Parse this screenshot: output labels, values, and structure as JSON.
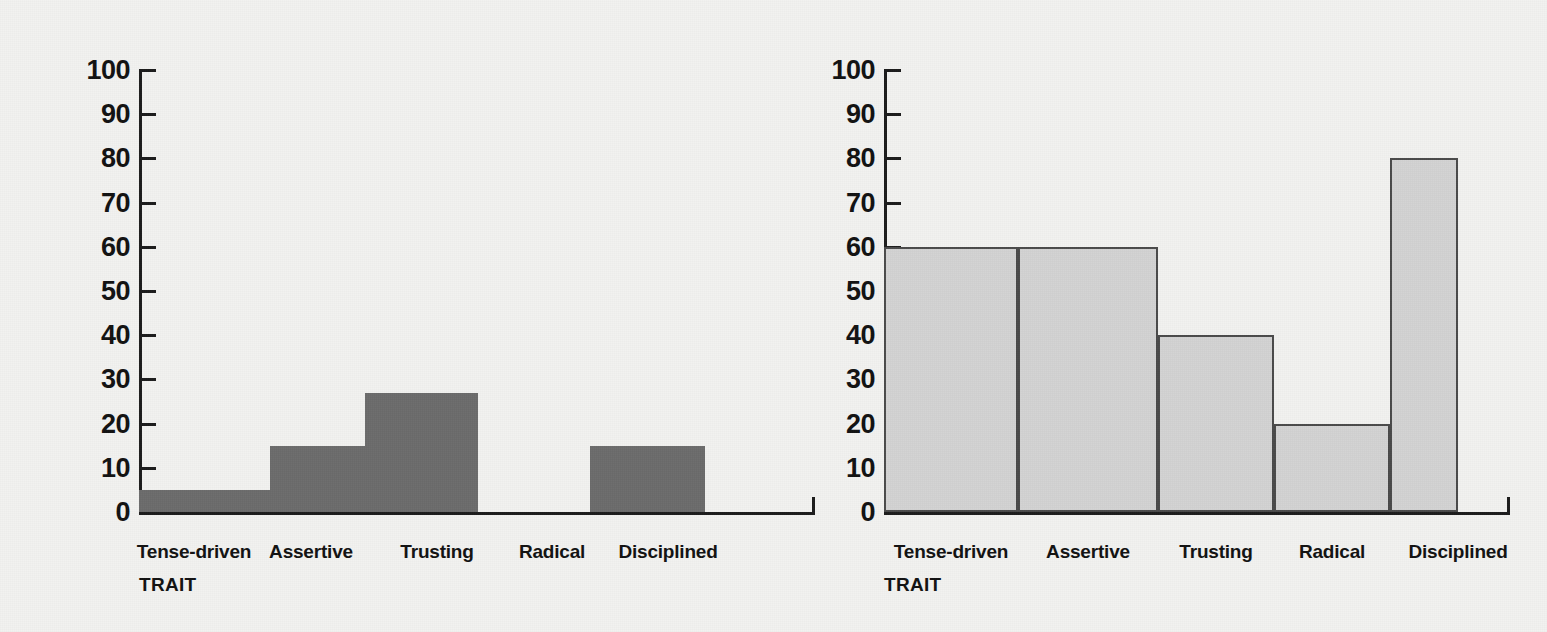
{
  "chart_data": [
    {
      "id": "left",
      "type": "bar",
      "title": "",
      "xlabel": "TRAIT",
      "ylabel": "",
      "categories": [
        "Tense-driven",
        "Assertive",
        "Trusting",
        "Radical",
        "Disciplined"
      ],
      "values": [
        5,
        15,
        27,
        0,
        15
      ],
      "ylim": [
        0,
        100
      ],
      "yticks": [
        0,
        10,
        20,
        30,
        40,
        50,
        60,
        70,
        80,
        90,
        100
      ],
      "ytick_labels": [
        "0",
        "10",
        "20",
        "30",
        "40",
        "50",
        "60",
        "70",
        "80",
        "90",
        "100"
      ],
      "grid": false,
      "legend": "none",
      "bar_style": "solid-dark-gray",
      "bar_color": "#6b6b6b"
    },
    {
      "id": "right",
      "type": "bar",
      "title": "",
      "xlabel": "TRAIT",
      "ylabel": "",
      "categories": [
        "Tense-driven",
        "Assertive",
        "Trusting",
        "Radical",
        "Disciplined"
      ],
      "values": [
        60,
        60,
        40,
        20,
        80
      ],
      "ylim": [
        0,
        100
      ],
      "yticks": [
        0,
        10,
        20,
        30,
        40,
        50,
        60,
        70,
        80,
        90,
        100
      ],
      "ytick_labels": [
        "0",
        "10",
        "20",
        "30",
        "40",
        "50",
        "60",
        "70",
        "80",
        "90",
        "100"
      ],
      "grid": false,
      "legend": "none",
      "bar_style": "light-gray-outlined",
      "bar_color": "#d2d2d2",
      "bar_border_color": "#4a4a4a"
    }
  ],
  "colors": {
    "background": "#f2f2f0",
    "axis": "#1b1b1b",
    "text": "#111111",
    "bar_dark": "#6b6b6b",
    "bar_light": "#d2d2d2"
  }
}
